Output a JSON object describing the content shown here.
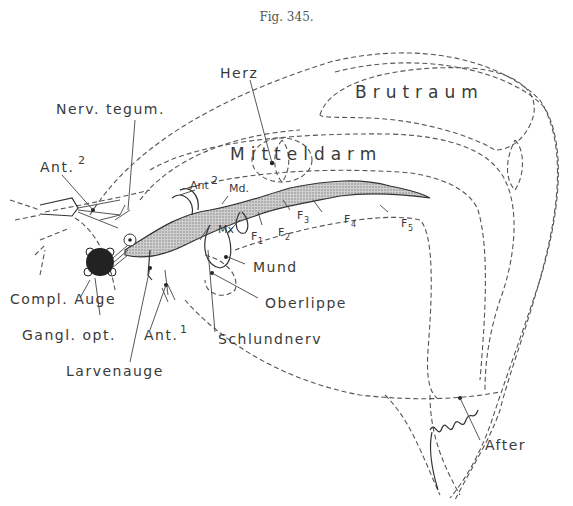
{
  "figure": {
    "title": "Fig. 345.",
    "labels": {
      "herz": "Herz",
      "brutraum": "Brutraum",
      "mitteldarm": "Mitteldarm",
      "nerv_tegum": "Nerv. tegum.",
      "ant2_left": "Ant.",
      "ant2_left_sup": "2",
      "ant2_mid": "Ant",
      "ant2_mid_sup": "2",
      "md": "Md.",
      "mx": "Mx",
      "f1": "F",
      "f1_sub": "1",
      "f2": "F",
      "f2_sub": "2",
      "f3": "F",
      "f3_sub": "3",
      "f4": "F",
      "f4_sub": "4",
      "f5": "F",
      "f5_sub": "5",
      "mund": "Mund",
      "oberlippe": "Oberlippe",
      "compl_auge": "Compl. Auge",
      "gangl_opt": "Gangl. opt.",
      "ant1": "Ant.",
      "ant1_sup": "1",
      "schlundnerv": "Schlundnerv",
      "larvenauge": "Larvenauge",
      "after": "After"
    },
    "colors": {
      "ink": "#3a3a3a",
      "background": "#ffffff",
      "stipple": "#9a9a9a"
    }
  }
}
